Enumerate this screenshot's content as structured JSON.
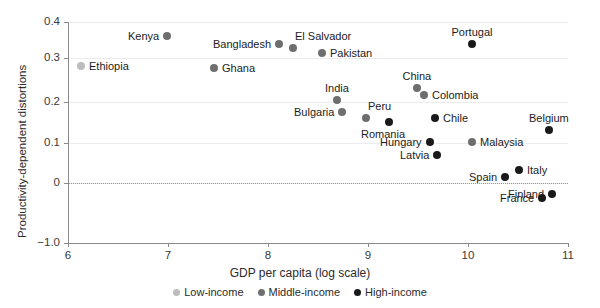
{
  "chart_data": {
    "type": "scatter",
    "title": "",
    "xlabel": "GDP per capita (log scale)",
    "ylabel": "Productivity-dependent distortions",
    "xlim": [
      6,
      11
    ],
    "ylim": [
      -1.0,
      0.4
    ],
    "xticks": [
      "6",
      "7",
      "8",
      "9",
      "10",
      "11"
    ],
    "yticks": [
      "0.4",
      "0.3",
      "0.2",
      "0.1",
      "0",
      "−1.0"
    ],
    "grid": true,
    "zero_reference_line": true,
    "legend_position": "bottom",
    "series": [
      {
        "name": "Low-income",
        "color": "#bdbdbd"
      },
      {
        "name": "Middle-income",
        "color": "#6e6e6e"
      },
      {
        "name": "High-income",
        "color": "#1a1a1a"
      }
    ],
    "points": [
      {
        "label": "Ethiopia",
        "group": "Low-income",
        "x": 6.13,
        "y": 0.291,
        "px": 81,
        "py": 66,
        "label_side": "right"
      },
      {
        "label": "Kenya",
        "group": "Middle-income",
        "x": 6.99,
        "y": 0.367,
        "px": 167,
        "py": 36,
        "label_side": "left"
      },
      {
        "label": "Ghana",
        "group": "Middle-income",
        "x": 7.46,
        "y": 0.285,
        "px": 214,
        "py": 68,
        "label_side": "right"
      },
      {
        "label": "Bangladesh",
        "group": "Middle-income",
        "x": 8.11,
        "y": 0.344,
        "px": 279,
        "py": 44,
        "label_side": "left"
      },
      {
        "label": "El Salvador",
        "group": "Middle-income",
        "x": 8.25,
        "y": 0.334,
        "px": 293,
        "py": 48,
        "label_side": "above-right"
      },
      {
        "label": "Pakistan",
        "group": "Middle-income",
        "x": 8.54,
        "y": 0.321,
        "px": 322,
        "py": 53,
        "label_side": "right"
      },
      {
        "label": "India",
        "group": "Middle-income",
        "x": 8.69,
        "y": 0.205,
        "px": 337,
        "py": 100,
        "label_side": "above"
      },
      {
        "label": "Bulgaria",
        "group": "Middle-income",
        "x": 8.74,
        "y": 0.176,
        "px": 342,
        "py": 112,
        "label_side": "left"
      },
      {
        "label": "Peru",
        "group": "Middle-income",
        "x": 8.98,
        "y": 0.161,
        "px": 366,
        "py": 118,
        "label_side": "above-right"
      },
      {
        "label": "Romania",
        "group": "High-income",
        "x": 9.21,
        "y": 0.151,
        "px": 389,
        "py": 122,
        "label_side": "below-left"
      },
      {
        "label": "China",
        "group": "Middle-income",
        "x": 9.49,
        "y": 0.237,
        "px": 417,
        "py": 88,
        "label_side": "above"
      },
      {
        "label": "Colombia",
        "group": "Middle-income",
        "x": 9.56,
        "y": 0.219,
        "px": 424,
        "py": 95,
        "label_side": "right"
      },
      {
        "label": "Chile",
        "group": "High-income",
        "x": 9.67,
        "y": 0.161,
        "px": 435,
        "py": 118,
        "label_side": "right"
      },
      {
        "label": "Hungary",
        "group": "High-income",
        "x": 9.62,
        "y": 0.101,
        "px": 430,
        "py": 142,
        "label_side": "left"
      },
      {
        "label": "Latvia",
        "group": "High-income",
        "x": 9.69,
        "y": 0.068,
        "px": 437,
        "py": 155,
        "label_side": "left"
      },
      {
        "label": "Portugal",
        "group": "High-income",
        "x": 10.04,
        "y": 0.344,
        "px": 472,
        "py": 44,
        "label_side": "above"
      },
      {
        "label": "Malaysia",
        "group": "Middle-income",
        "x": 10.04,
        "y": 0.101,
        "px": 472,
        "py": 142,
        "label_side": "right"
      },
      {
        "label": "Spain",
        "group": "High-income",
        "x": 10.37,
        "y": 0.016,
        "px": 505,
        "py": 177,
        "label_side": "left"
      },
      {
        "label": "Italy",
        "group": "High-income",
        "x": 10.51,
        "y": 0.033,
        "px": 519,
        "py": 170,
        "label_side": "right"
      },
      {
        "label": "France",
        "group": "High-income",
        "x": 10.74,
        "y": -0.037,
        "px": 542,
        "py": 198,
        "label_side": "left"
      },
      {
        "label": "Finland",
        "group": "High-income",
        "x": 10.84,
        "y": -0.027,
        "px": 552,
        "py": 194,
        "label_side": "left"
      },
      {
        "label": "Belgium",
        "group": "High-income",
        "x": 10.81,
        "y": 0.133,
        "px": 549,
        "py": 130,
        "label_side": "above"
      }
    ]
  },
  "axes": {
    "y_title": "Productivity-dependent distortions",
    "x_title": "GDP per capita (log scale)",
    "y_tick_labels": [
      "0.4",
      "0.3",
      "0.2",
      "0.1",
      "0",
      "−1.0"
    ],
    "y_tick_py": [
      22,
      58,
      102,
      143,
      183,
      243
    ],
    "x_tick_labels": [
      "6",
      "7",
      "8",
      "9",
      "10",
      "11"
    ],
    "x_tick_px": [
      68,
      168,
      268,
      368,
      468,
      568
    ]
  },
  "legend": {
    "items": [
      {
        "label": "Low-income",
        "color": "#bdbdbd"
      },
      {
        "label": "Middle-income",
        "color": "#6e6e6e"
      },
      {
        "label": "High-income",
        "color": "#1a1a1a"
      }
    ]
  }
}
